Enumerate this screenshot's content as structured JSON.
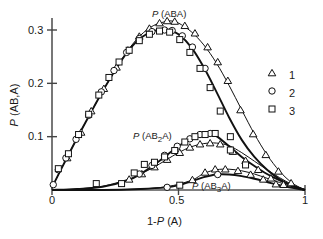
{
  "chart_data": {
    "type": "line",
    "title": "",
    "xlabel": "1-P (A)",
    "ylabel": "P (AB,A)",
    "xlim": [
      0,
      1
    ],
    "ylim": [
      0,
      0.335
    ],
    "xticks": [
      0,
      0.5,
      1
    ],
    "xticklabels": [
      "0",
      "0.5",
      "1"
    ],
    "yticks": [
      0.1,
      0.2,
      0.3
    ],
    "yticklabels": [
      "0.1",
      "0.2",
      "0.3"
    ],
    "grid": false,
    "legend_position": "right",
    "legend": [
      {
        "marker": "triangle",
        "label": "1"
      },
      {
        "marker": "circle",
        "label": "2"
      },
      {
        "marker": "square",
        "label": "3"
      }
    ],
    "annotations": [
      {
        "text": "P (ABA)",
        "x": 0.5,
        "y": 0.335
      },
      {
        "text": "P (AB2A)",
        "x": 0.44,
        "y": 0.118
      },
      {
        "text": "P (AB3A)",
        "x": 0.75,
        "y": 0.018
      }
    ],
    "curves": [
      {
        "name": "P (ABA)",
        "series": "model",
        "x": [
          0.0,
          0.05,
          0.1,
          0.15,
          0.2,
          0.25,
          0.3,
          0.35,
          0.4,
          0.45,
          0.47,
          0.5,
          0.55,
          0.6,
          0.65,
          0.7,
          0.75,
          0.8,
          0.85,
          0.9,
          0.95,
          1.0
        ],
        "y": [
          0.005,
          0.052,
          0.098,
          0.142,
          0.185,
          0.225,
          0.262,
          0.29,
          0.308,
          0.316,
          0.317,
          0.313,
          0.297,
          0.272,
          0.238,
          0.196,
          0.15,
          0.105,
          0.066,
          0.035,
          0.013,
          0.0
        ]
      },
      {
        "name": "P (ABA) set 2-3",
        "series": "model",
        "x": [
          0.0,
          0.05,
          0.1,
          0.15,
          0.2,
          0.25,
          0.3,
          0.35,
          0.4,
          0.44,
          0.47,
          0.5,
          0.55,
          0.6,
          0.65,
          0.7,
          0.75,
          0.8,
          0.85,
          0.9,
          0.95,
          1.0
        ],
        "y": [
          0.005,
          0.052,
          0.098,
          0.142,
          0.185,
          0.225,
          0.26,
          0.285,
          0.298,
          0.3,
          0.298,
          0.292,
          0.268,
          0.23,
          0.184,
          0.136,
          0.094,
          0.062,
          0.038,
          0.02,
          0.008,
          0.0
        ]
      },
      {
        "name": "P (AB2A)",
        "series": "model",
        "x": [
          0.0,
          0.1,
          0.2,
          0.3,
          0.35,
          0.4,
          0.45,
          0.5,
          0.55,
          0.58,
          0.62,
          0.65,
          0.7,
          0.75,
          0.8,
          0.85,
          0.9,
          0.95,
          1.0
        ],
        "y": [
          0.0,
          0.002,
          0.006,
          0.018,
          0.03,
          0.046,
          0.064,
          0.082,
          0.098,
          0.104,
          0.106,
          0.101,
          0.082,
          0.062,
          0.045,
          0.03,
          0.018,
          0.008,
          0.0
        ]
      },
      {
        "name": "P (AB2A) set 1",
        "series": "model",
        "x": [
          0.0,
          0.1,
          0.2,
          0.3,
          0.35,
          0.4,
          0.45,
          0.5,
          0.55,
          0.6,
          0.65,
          0.7,
          0.75,
          0.8,
          0.85,
          0.9,
          0.95,
          1.0
        ],
        "y": [
          0.0,
          0.002,
          0.007,
          0.02,
          0.03,
          0.042,
          0.056,
          0.07,
          0.081,
          0.087,
          0.088,
          0.083,
          0.07,
          0.054,
          0.038,
          0.023,
          0.01,
          0.0
        ]
      },
      {
        "name": "P (AB3A)",
        "series": "model",
        "x": [
          0.0,
          0.2,
          0.35,
          0.45,
          0.5,
          0.55,
          0.6,
          0.65,
          0.7,
          0.75,
          0.8,
          0.85,
          0.9,
          0.95,
          1.0
        ],
        "y": [
          0.0,
          0.0,
          0.002,
          0.005,
          0.009,
          0.016,
          0.024,
          0.029,
          0.029,
          0.026,
          0.021,
          0.015,
          0.009,
          0.004,
          0.0
        ]
      },
      {
        "name": "P (AB3A) set 1",
        "series": "model",
        "x": [
          0.0,
          0.3,
          0.45,
          0.55,
          0.6,
          0.65,
          0.7,
          0.75,
          0.8,
          0.85,
          0.9,
          0.95,
          1.0
        ],
        "y": [
          0.0,
          0.001,
          0.006,
          0.018,
          0.031,
          0.038,
          0.039,
          0.036,
          0.03,
          0.022,
          0.014,
          0.006,
          0.0
        ]
      }
    ],
    "points": [
      {
        "name": "1",
        "marker": "triangle",
        "curve": "P (ABA)",
        "x": [
          0.06,
          0.115,
          0.155,
          0.205,
          0.255,
          0.3,
          0.345,
          0.385,
          0.425,
          0.455,
          0.485,
          0.525,
          0.565,
          0.615,
          0.655,
          0.695,
          0.745,
          0.795,
          0.845,
          0.895,
          0.945
        ],
        "y": [
          0.06,
          0.108,
          0.148,
          0.19,
          0.23,
          0.262,
          0.288,
          0.303,
          0.313,
          0.317,
          0.316,
          0.308,
          0.294,
          0.268,
          0.24,
          0.205,
          0.15,
          0.105,
          0.066,
          0.035,
          0.013
        ]
      },
      {
        "name": "1",
        "marker": "triangle",
        "curve": "P (AB2A)",
        "x": [
          0.305,
          0.355,
          0.405,
          0.455,
          0.505,
          0.545,
          0.585,
          0.625,
          0.665,
          0.715,
          0.765,
          0.815,
          0.865,
          0.915
        ],
        "y": [
          0.02,
          0.03,
          0.043,
          0.057,
          0.07,
          0.08,
          0.086,
          0.088,
          0.086,
          0.072,
          0.055,
          0.038,
          0.022,
          0.01
        ]
      },
      {
        "name": "1",
        "marker": "triangle",
        "curve": "P (AB3A)",
        "x": [
          0.555,
          0.605,
          0.645,
          0.685,
          0.735,
          0.785,
          0.835,
          0.885
        ],
        "y": [
          0.019,
          0.033,
          0.039,
          0.039,
          0.036,
          0.029,
          0.02,
          0.011
        ]
      },
      {
        "name": "2",
        "marker": "circle",
        "curve": "P (ABA)",
        "x": [
          0.005,
          0.025,
          0.055,
          0.095,
          0.145,
          0.195,
          0.245,
          0.295,
          0.345,
          0.395,
          0.445,
          0.475,
          0.515,
          0.555,
          0.605
        ],
        "y": [
          0.01,
          0.038,
          0.06,
          0.095,
          0.14,
          0.184,
          0.224,
          0.258,
          0.284,
          0.297,
          0.3,
          0.299,
          0.289,
          0.268,
          0.228
        ]
      },
      {
        "name": "2",
        "marker": "circle",
        "curve": "P (AB2A)",
        "x": [
          0.345,
          0.395,
          0.445,
          0.495,
          0.545,
          0.585,
          0.625
        ],
        "y": [
          0.03,
          0.046,
          0.065,
          0.082,
          0.096,
          0.104,
          0.106
        ]
      },
      {
        "name": "2",
        "marker": "circle",
        "curve": "P (AB3A)",
        "x": [
          0.455,
          0.655
        ],
        "y": [
          0.005,
          0.029
        ]
      },
      {
        "name": "3",
        "marker": "square",
        "curve": "P (ABA)",
        "x": [
          0.025,
          0.065,
          0.105,
          0.145,
          0.185,
          0.225,
          0.265,
          0.305,
          0.345,
          0.385,
          0.425,
          0.465,
          0.505,
          0.545,
          0.585,
          0.625,
          0.665,
          0.705
        ],
        "y": [
          0.04,
          0.068,
          0.104,
          0.142,
          0.178,
          0.211,
          0.24,
          0.262,
          0.28,
          0.292,
          0.298,
          0.296,
          0.282,
          0.258,
          0.228,
          0.192,
          0.148,
          0.1
        ]
      },
      {
        "name": "3",
        "marker": "square",
        "curve": "P (AB2A)",
        "x": [
          0.325,
          0.365,
          0.405,
          0.445,
          0.485,
          0.525,
          0.565,
          0.605,
          0.645,
          0.705,
          0.765
        ],
        "y": [
          0.032,
          0.048,
          0.052,
          0.062,
          0.074,
          0.09,
          0.1,
          0.104,
          0.106,
          0.075,
          0.047
        ]
      },
      {
        "name": "3",
        "marker": "square",
        "curve": "P (AB3A)",
        "x": [
          0.175,
          0.275,
          0.505
        ],
        "y": [
          0.012,
          0.012,
          0.009
        ]
      }
    ]
  },
  "axis": {
    "x_tick_0": "0",
    "x_tick_1": "0.5",
    "x_tick_2": "1",
    "y_tick_0": "0.1",
    "y_tick_1": "0.2",
    "y_tick_2": "0.3",
    "x_title_prefix": "1-",
    "x_title_italic": "P",
    "x_title_suffix": " (A)",
    "y_title_italic": "P",
    "y_title_suffix": " (AB,A)"
  },
  "labels": {
    "aba_italic": "P",
    "aba_text": " (ABA)",
    "ab2a_italic": "P",
    "ab2a_pre": " (AB",
    "ab2a_sub": "2",
    "ab2a_post": "A)",
    "ab3a_italic": "P",
    "ab3a_pre": " (AB",
    "ab3a_sub": "3",
    "ab3a_post": "A)"
  },
  "legend": {
    "item1": "1",
    "item2": "2",
    "item3": "3"
  }
}
